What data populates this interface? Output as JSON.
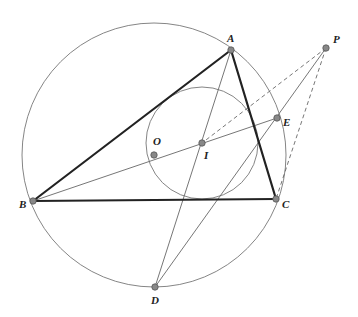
{
  "points": {
    "A": {
      "label": "A",
      "x": 231,
      "y": 50,
      "lx": 227,
      "ly": 42
    },
    "B": {
      "label": "B",
      "x": 33,
      "y": 201,
      "lx": 19,
      "ly": 208
    },
    "C": {
      "label": "C",
      "x": 276,
      "y": 199,
      "lx": 282,
      "ly": 208
    },
    "D": {
      "label": "D",
      "x": 155,
      "y": 287,
      "lx": 151,
      "ly": 304
    },
    "E": {
      "label": "E",
      "x": 277,
      "y": 118,
      "lx": 283,
      "ly": 126
    },
    "I": {
      "label": "I",
      "x": 202,
      "y": 143,
      "lx": 204,
      "ly": 159
    },
    "O": {
      "label": "O",
      "x": 154,
      "y": 155,
      "lx": 153,
      "ly": 145
    },
    "P": {
      "label": "P",
      "x": 326,
      "y": 48,
      "lx": 333,
      "ly": 43
    }
  },
  "circles": {
    "circumcircle": {
      "cx": 154,
      "cy": 155,
      "r": 132
    },
    "incircle": {
      "cx": 202,
      "cy": 143,
      "r": 56
    }
  },
  "segments": {
    "triangle": [
      [
        "A",
        "B"
      ],
      [
        "B",
        "C"
      ],
      [
        "C",
        "A"
      ]
    ],
    "solid": [
      [
        "A",
        "D"
      ],
      [
        "B",
        "E"
      ],
      [
        "D",
        "P"
      ]
    ],
    "dashed": [
      [
        "P",
        "I"
      ],
      [
        "P",
        "C"
      ]
    ]
  },
  "colors": {
    "triangle": "#222222",
    "thin": "#666666",
    "point_fill": "#888888",
    "point_stroke": "#555555"
  }
}
